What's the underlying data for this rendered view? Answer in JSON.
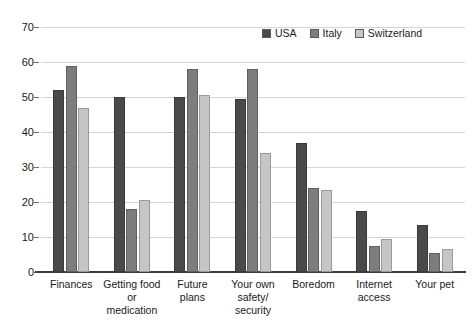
{
  "chart_data": {
    "type": "bar",
    "title": "",
    "subtitle": "",
    "xlabel": "",
    "ylabel": "",
    "ylim": [
      0,
      70
    ],
    "ytick_step": 10,
    "yticks": [
      0,
      10,
      20,
      30,
      40,
      50,
      60,
      70
    ],
    "grid": true,
    "legend_position": "top-right",
    "categories": [
      "Finances",
      "Getting food\nor\nmedication",
      "Future\nplans",
      "Your own\nsafety/\nsecurity",
      "Boredom",
      "Internet\naccess",
      "Your pet"
    ],
    "series": [
      {
        "name": "USA",
        "color": "#4a4a4a",
        "values": [
          52,
          50,
          50,
          49.5,
          37,
          17.5,
          13.5
        ]
      },
      {
        "name": "Italy",
        "color": "#7d7d7d",
        "values": [
          59,
          18,
          58,
          58,
          24,
          7.5,
          5.5
        ]
      },
      {
        "name": "Switzerland",
        "color": "#c6c6c6",
        "values": [
          47,
          20.5,
          50.5,
          34,
          23.5,
          9.5,
          6.5
        ]
      }
    ]
  },
  "legend": {
    "entries": [
      {
        "label": "USA"
      },
      {
        "label": "Italy"
      },
      {
        "label": "Switzerland"
      }
    ]
  }
}
